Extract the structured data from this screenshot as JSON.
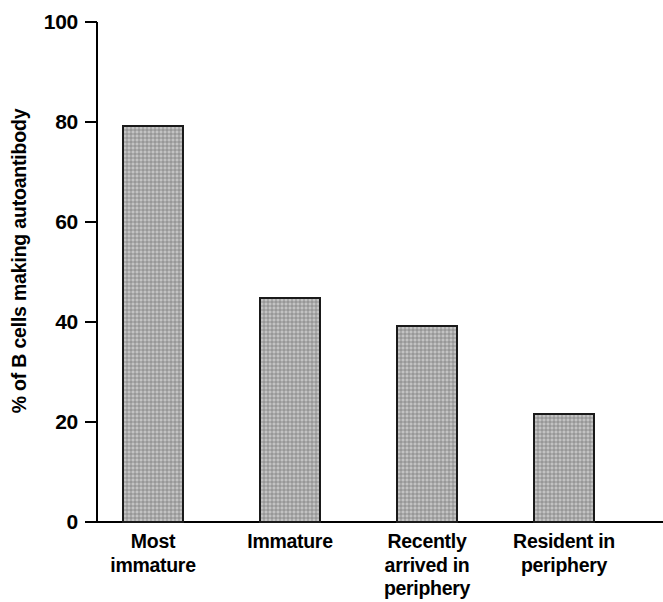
{
  "chart_data": {
    "type": "bar",
    "title": "",
    "subtitle": "",
    "xlabel": "",
    "ylabel": "% of B cells making autoantibody",
    "categories": [
      "Most immature",
      "Immature",
      "Recently arrived in periphery",
      "Resident in periphery"
    ],
    "category_lines": [
      [
        "Most",
        "immature"
      ],
      [
        "Immature"
      ],
      [
        "Recently",
        "arrived in",
        "periphery"
      ],
      [
        "Resident in",
        "periphery"
      ]
    ],
    "values": [
      79.5,
      45,
      39.5,
      21.8
    ],
    "ylim": [
      0,
      100
    ],
    "yticks": [
      0,
      20,
      40,
      60,
      80,
      100
    ],
    "ytick_labels": [
      "0",
      "20",
      "40",
      "60",
      "80",
      "100"
    ],
    "grid": false,
    "legend": false,
    "legend_position": "none",
    "bar_fill_color": "#a9a9a9",
    "bar_edge_color": "#1a1a1a",
    "axis_color": "#000000",
    "background_color": "#ffffff"
  }
}
